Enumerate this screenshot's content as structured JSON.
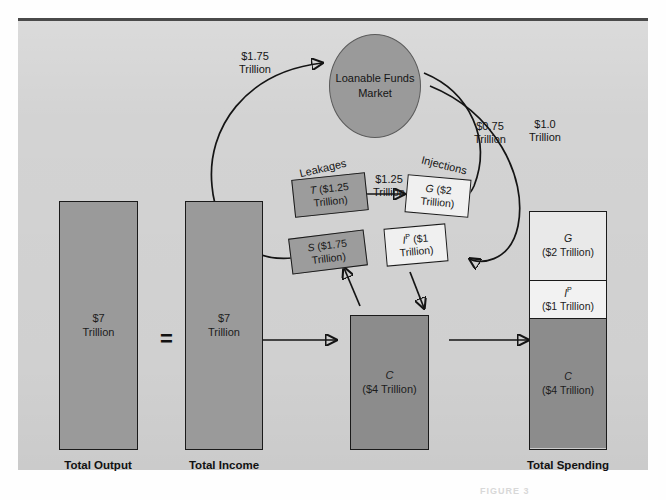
{
  "figure": {
    "caption": "FIGURE 3"
  },
  "market": {
    "label": "Loanable\nFunds\nMarket"
  },
  "flows": {
    "savings_to_market": "$1.75\nTrillion",
    "market_to_government": "$0.75\nTrillion",
    "market_to_investment": "$1.0\nTrillion",
    "taxes_to_government": "$1.25\nTrillion"
  },
  "groups": {
    "leakages_label": "Leakages",
    "injections_label": "Injections"
  },
  "leakages": [
    {
      "name": "taxes-box",
      "symbol": "T",
      "value": "($1.25",
      "value2": "Trillion)"
    },
    {
      "name": "savings-box",
      "symbol": "S",
      "value": "($1.75",
      "value2": "Trillion)"
    }
  ],
  "injections": [
    {
      "name": "government-box",
      "symbol": "G",
      "value": "($2",
      "value2": "Trillion)"
    },
    {
      "name": "investment-box",
      "symbol": "I",
      "sup": "P",
      "value": "($1",
      "value2": "Trillion)"
    }
  ],
  "bars": {
    "total_output": {
      "value": "$7",
      "unit": "Trillion",
      "caption": "Total\nOutput"
    },
    "total_income": {
      "value": "$7",
      "unit": "Trillion",
      "caption": "Total\nIncome"
    },
    "consumption": {
      "symbol": "C",
      "value": "($4 Trillion)"
    },
    "total_spending": {
      "caption": "Total\nSpending"
    }
  },
  "equals_sign": "=",
  "spending_stack": [
    {
      "symbol": "G",
      "sup": "",
      "value": "($2 Trillion)",
      "shade": "light"
    },
    {
      "symbol": "I",
      "sup": "P",
      "value": "($1 Trillion)",
      "shade": "light2"
    },
    {
      "symbol": "C",
      "sup": "",
      "value": "($4 Trillion)",
      "shade": "dark"
    }
  ],
  "colors": {
    "panel_bg": "#d3d3d3",
    "bar_mid": "#9a9a9a",
    "bar_dark": "#8c8c8c",
    "bar_light": "#e9e9e9",
    "stroke": "#141414"
  }
}
